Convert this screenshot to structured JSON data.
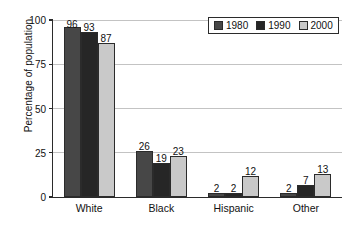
{
  "chart_data": {
    "type": "bar",
    "title": "",
    "subtitle": "",
    "xlabel": "",
    "ylabel": "Percentage of population",
    "categories": [
      "White",
      "Black",
      "Hispanic",
      "Other"
    ],
    "series": [
      {
        "name": "1980",
        "color": "#474747",
        "values": [
          96,
          26,
          2,
          2
        ]
      },
      {
        "name": "1990",
        "color": "#262626",
        "values": [
          93,
          19,
          2,
          7
        ]
      },
      {
        "name": "2000",
        "color": "#c9c9c9",
        "values": [
          87,
          23,
          12,
          13
        ]
      }
    ],
    "ylim": [
      0,
      100
    ],
    "yticks": [
      0,
      25,
      50,
      75,
      100
    ],
    "ytick_labels": [
      "0",
      "25",
      "50",
      "75",
      "100"
    ],
    "grid": true,
    "grid_axis": "y",
    "legend_position": "top-right",
    "data_labels": true,
    "bar_border_color": "#2b2b2b",
    "axis_color": "#2b2b2b",
    "grid_color": "#c3c3c3",
    "background": "#ffffff"
  },
  "legend": {
    "entries": [
      {
        "label": "1980",
        "swatch": "legend-swatch-1980"
      },
      {
        "label": "1990",
        "swatch": "legend-swatch-1990"
      },
      {
        "label": "2000",
        "swatch": "legend-swatch-2000"
      }
    ]
  }
}
